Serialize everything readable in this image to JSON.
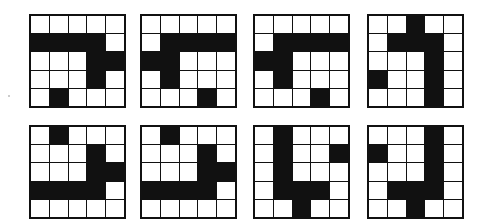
{
  "puzzle": {
    "colors": {
      "filled": "#111111",
      "empty": "#ffffff"
    },
    "grids": [
      {
        "id": 1,
        "cells": [
          [
            0,
            0,
            0,
            0,
            0
          ],
          [
            1,
            1,
            1,
            1,
            0
          ],
          [
            0,
            0,
            0,
            1,
            1
          ],
          [
            0,
            0,
            0,
            1,
            0
          ],
          [
            0,
            1,
            0,
            0,
            0
          ]
        ]
      },
      {
        "id": 2,
        "cells": [
          [
            0,
            0,
            0,
            0,
            0
          ],
          [
            0,
            1,
            1,
            1,
            1
          ],
          [
            1,
            1,
            0,
            0,
            0
          ],
          [
            0,
            1,
            0,
            0,
            0
          ],
          [
            0,
            0,
            0,
            1,
            0
          ]
        ]
      },
      {
        "id": 3,
        "cells": [
          [
            0,
            0,
            0,
            0,
            0
          ],
          [
            0,
            1,
            1,
            1,
            1
          ],
          [
            1,
            1,
            0,
            0,
            0
          ],
          [
            0,
            1,
            0,
            0,
            0
          ],
          [
            0,
            0,
            0,
            1,
            0
          ]
        ]
      },
      {
        "id": 4,
        "cells": [
          [
            0,
            0,
            1,
            0,
            0
          ],
          [
            0,
            1,
            1,
            1,
            0
          ],
          [
            0,
            0,
            0,
            1,
            0
          ],
          [
            1,
            0,
            0,
            1,
            0
          ],
          [
            0,
            0,
            0,
            1,
            0
          ]
        ]
      },
      {
        "id": 5,
        "cells": [
          [
            0,
            1,
            0,
            0,
            0
          ],
          [
            0,
            0,
            0,
            1,
            0
          ],
          [
            0,
            0,
            0,
            1,
            1
          ],
          [
            1,
            1,
            1,
            1,
            0
          ],
          [
            0,
            0,
            0,
            0,
            0
          ]
        ]
      },
      {
        "id": 6,
        "cells": [
          [
            0,
            1,
            0,
            0,
            0
          ],
          [
            0,
            0,
            0,
            1,
            0
          ],
          [
            0,
            0,
            0,
            1,
            1
          ],
          [
            1,
            1,
            1,
            1,
            0
          ],
          [
            0,
            0,
            0,
            0,
            0
          ]
        ]
      },
      {
        "id": 7,
        "cells": [
          [
            0,
            1,
            0,
            0,
            0
          ],
          [
            0,
            1,
            0,
            0,
            1
          ],
          [
            0,
            1,
            0,
            0,
            0
          ],
          [
            0,
            1,
            1,
            1,
            0
          ],
          [
            0,
            0,
            1,
            0,
            0
          ]
        ]
      },
      {
        "id": 8,
        "cells": [
          [
            0,
            0,
            0,
            1,
            0
          ],
          [
            1,
            0,
            0,
            1,
            0
          ],
          [
            0,
            0,
            0,
            1,
            0
          ],
          [
            0,
            1,
            1,
            1,
            0
          ],
          [
            0,
            0,
            1,
            0,
            0
          ]
        ]
      }
    ]
  }
}
